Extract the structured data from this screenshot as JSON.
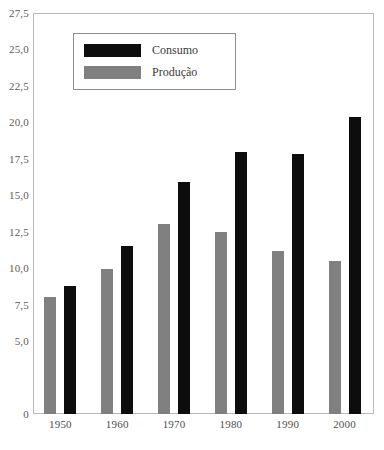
{
  "chart_data": {
    "type": "bar",
    "title": "",
    "subtitle": "",
    "xlabel": "",
    "ylabel": "",
    "categories": [
      "1950",
      "1960",
      "1970",
      "1980",
      "1990",
      "2000"
    ],
    "series": [
      {
        "name": "Produção",
        "color": "#808080",
        "values": [
          8.0,
          9.95,
          13.0,
          12.45,
          11.15,
          10.5
        ]
      },
      {
        "name": "Consumo",
        "color": "#0d0d0d",
        "values": [
          8.8,
          11.5,
          15.9,
          18.0,
          17.8,
          20.4
        ]
      }
    ],
    "ylim": [
      0,
      27.5
    ],
    "yticks": [
      0,
      5.0,
      7.5,
      10.0,
      12.5,
      15.0,
      17.5,
      20.0,
      22.5,
      25.0,
      27.5
    ],
    "ytick_labels": [
      "0",
      "5,0",
      "7,5",
      "10,0",
      "12,5",
      "15,0",
      "17,5",
      "20,0",
      "22,5",
      "25,0",
      "27,5"
    ],
    "xtick_labels": [
      "1950",
      "1960",
      "1970",
      "1980",
      "1990",
      "2000"
    ],
    "grid": false,
    "legend_position": "top-left",
    "legend_entries": [
      {
        "label": "Consumo",
        "color": "#0d0d0d"
      },
      {
        "label": "Produção",
        "color": "#808080"
      }
    ]
  },
  "legend": {
    "entries": [
      {
        "label": "Consumo",
        "swatch": "sw-consumo"
      },
      {
        "label": "Produção",
        "swatch": "sw-producao"
      }
    ]
  },
  "colors": {
    "consumo": "#0d0d0d",
    "producao": "#808080",
    "frame": "#b9b9b9",
    "legend_border": "#8e8e8e",
    "tick_text": "#5b5b5b",
    "background": "#ffffff"
  }
}
